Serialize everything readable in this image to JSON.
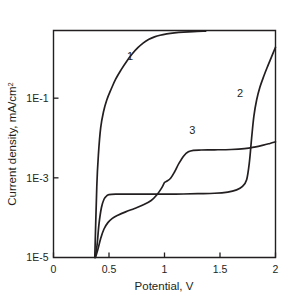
{
  "chart_data": {
    "type": "line",
    "title": "",
    "xlabel": "Potential, V",
    "ylabel": "Current density, mA/cm²",
    "ylabel_base": "Current density, mA/cm",
    "ylabel_exponent": "2",
    "xlim": [
      0,
      2
    ],
    "ylim": [
      1e-05,
      5
    ],
    "yscale": "log",
    "xscale": "linear",
    "grid": false,
    "legend": "inline-curve-numbers",
    "xticks": [
      0,
      0.5,
      1,
      1.5,
      2
    ],
    "xticklabels": [
      "0",
      "0.5",
      "1",
      "1.5",
      "2"
    ],
    "yticks": [
      1e-05,
      0.001,
      0.1
    ],
    "yticklabels": [
      "1E-5",
      "1E-3",
      "1E-1"
    ],
    "annotations": [
      {
        "text": "1",
        "x": 0.69,
        "y": 0.9
      },
      {
        "text": "2",
        "x": 1.68,
        "y": 0.105
      },
      {
        "text": "3",
        "x": 1.25,
        "y": 0.0125
      }
    ],
    "series": [
      {
        "name": "1",
        "label": "1",
        "points": [
          [
            0.372,
            1e-05
          ],
          [
            0.39,
            0.0006
          ],
          [
            0.405,
            0.004
          ],
          [
            0.425,
            0.018
          ],
          [
            0.45,
            0.045
          ],
          [
            0.48,
            0.09
          ],
          [
            0.52,
            0.17
          ],
          [
            0.56,
            0.3
          ],
          [
            0.61,
            0.52
          ],
          [
            0.66,
            0.85
          ],
          [
            0.71,
            1.3
          ],
          [
            0.76,
            1.85
          ],
          [
            0.81,
            2.45
          ],
          [
            0.86,
            3.0
          ],
          [
            0.91,
            3.45
          ],
          [
            0.96,
            3.8
          ],
          [
            1.02,
            4.1
          ],
          [
            1.09,
            4.35
          ],
          [
            1.17,
            4.55
          ],
          [
            1.26,
            4.7
          ],
          [
            1.37,
            4.8
          ]
        ]
      },
      {
        "name": "2",
        "label": "2",
        "points": [
          [
            0.374,
            1e-05
          ],
          [
            0.392,
            2e-05
          ],
          [
            0.41,
            7e-05
          ],
          [
            0.432,
            0.00018
          ],
          [
            0.455,
            0.00029
          ],
          [
            0.478,
            0.00035
          ],
          [
            0.5,
            0.00038
          ],
          [
            0.56,
            0.00039
          ],
          [
            0.7,
            0.00039
          ],
          [
            0.9,
            0.00039
          ],
          [
            1.1,
            0.00039
          ],
          [
            1.3,
            0.0004
          ],
          [
            1.45,
            0.00041
          ],
          [
            1.57,
            0.00044
          ],
          [
            1.65,
            0.0005
          ],
          [
            1.7,
            0.0006
          ],
          [
            1.74,
            0.0009
          ],
          [
            1.765,
            0.0025
          ],
          [
            1.785,
            0.01
          ],
          [
            1.805,
            0.035
          ],
          [
            1.83,
            0.09
          ],
          [
            1.86,
            0.19
          ],
          [
            1.895,
            0.36
          ],
          [
            1.93,
            0.64
          ],
          [
            1.965,
            1.1
          ],
          [
            2.0,
            1.9
          ]
        ]
      },
      {
        "name": "3",
        "label": "3",
        "points": [
          [
            0.378,
            1e-05
          ],
          [
            0.4,
            1.6e-05
          ],
          [
            0.425,
            3e-05
          ],
          [
            0.455,
            5.2e-05
          ],
          [
            0.49,
            7.5e-05
          ],
          [
            0.53,
            9.6e-05
          ],
          [
            0.58,
            0.000115
          ],
          [
            0.65,
            0.00014
          ],
          [
            0.73,
            0.00017
          ],
          [
            0.81,
            0.00021
          ],
          [
            0.88,
            0.00027
          ],
          [
            0.93,
            0.00037
          ],
          [
            0.975,
            0.00056
          ],
          [
            1.0,
            0.00076
          ],
          [
            1.02,
            0.00082
          ],
          [
            1.055,
            0.00098
          ],
          [
            1.09,
            0.0014
          ],
          [
            1.13,
            0.0023
          ],
          [
            1.175,
            0.0036
          ],
          [
            1.215,
            0.0045
          ],
          [
            1.26,
            0.0049
          ],
          [
            1.33,
            0.005
          ],
          [
            1.45,
            0.00505
          ],
          [
            1.6,
            0.00515
          ],
          [
            1.72,
            0.0054
          ],
          [
            1.81,
            0.0059
          ],
          [
            1.89,
            0.0066
          ],
          [
            1.95,
            0.0073
          ],
          [
            2.0,
            0.008
          ]
        ]
      }
    ]
  }
}
